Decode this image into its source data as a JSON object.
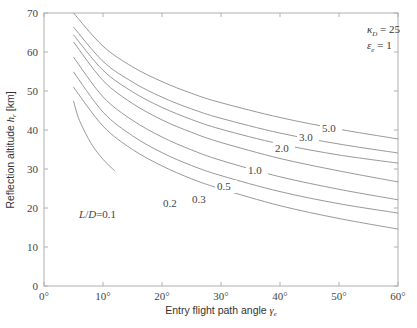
{
  "chart_data": {
    "type": "line",
    "title": "",
    "xlabel": "Entry flight path angle γ_e",
    "ylabel": "Reflection altitude h_r [km]",
    "xlim": [
      0,
      60
    ],
    "ylim": [
      0,
      70
    ],
    "x_ticks": [
      "0°",
      "10°",
      "20°",
      "30°",
      "40°",
      "50°",
      "60°"
    ],
    "y_ticks": [
      "0",
      "10",
      "20",
      "30",
      "40",
      "50",
      "60",
      "70"
    ],
    "grid": false,
    "legend": "inline curve labels",
    "annotations": [
      "κ_D = 25",
      "ε_e = 1"
    ],
    "series": [
      {
        "name": "L/D = 0.1",
        "label": "L/D = 0.1",
        "x": [
          5,
          6,
          8,
          10,
          12
        ],
        "y": [
          47.4,
          42.5,
          36.5,
          32.5,
          29.5
        ]
      },
      {
        "name": "0.2",
        "label": "0.2",
        "x": [
          5,
          10,
          15,
          20,
          25,
          30,
          40,
          50,
          60
        ],
        "y": [
          51.0,
          41.0,
          35.0,
          30.8,
          27.5,
          24.9,
          20.6,
          17.3,
          14.6
        ]
      },
      {
        "name": "0.3",
        "label": "0.3",
        "x": [
          5,
          10,
          15,
          20,
          25,
          30,
          40,
          50,
          60
        ],
        "y": [
          54.9,
          44.6,
          38.5,
          34.2,
          30.9,
          28.3,
          24.2,
          21.1,
          18.7
        ]
      },
      {
        "name": "0.5",
        "label": "0.5",
        "x": [
          5,
          10,
          15,
          20,
          25,
          30,
          40,
          50,
          60
        ],
        "y": [
          58.7,
          48.5,
          42.5,
          38.2,
          34.9,
          32.2,
          28.0,
          24.8,
          22.1
        ]
      },
      {
        "name": "1.0",
        "label": "1.0",
        "x": [
          5,
          10,
          15,
          20,
          25,
          30,
          40,
          50,
          60
        ],
        "y": [
          62.6,
          52.7,
          46.8,
          42.6,
          39.4,
          36.8,
          32.7,
          29.5,
          26.7
        ]
      },
      {
        "name": "2.0",
        "label": "2.0",
        "x": [
          5,
          10,
          15,
          20,
          25,
          30,
          40,
          50,
          60
        ],
        "y": [
          64.4,
          55.3,
          49.8,
          45.8,
          42.7,
          40.2,
          36.4,
          33.6,
          31.5
        ]
      },
      {
        "name": "3.0",
        "label": "3.0",
        "x": [
          5,
          10,
          15,
          20,
          25,
          30,
          40,
          50,
          60
        ],
        "y": [
          66.4,
          57.6,
          52.3,
          48.4,
          45.4,
          43.0,
          39.2,
          36.4,
          34.1
        ]
      },
      {
        "name": "5.0",
        "label": "5.0",
        "x": [
          5,
          10,
          15,
          20,
          25,
          30,
          40,
          50,
          60
        ],
        "y": [
          70.0,
          61.5,
          56.2,
          52.4,
          49.4,
          47.0,
          43.2,
          40.2,
          37.7
        ]
      }
    ]
  },
  "labels": {
    "xlabel_text": "Entry flight path angle ",
    "xlabel_sym": "γ",
    "xlabel_sub": "e",
    "ylabel_text": "Reflection altitude ",
    "ylabel_sym": "h",
    "ylabel_sub": "r",
    "ylabel_unit": " [km]",
    "kappa_sym": "κ",
    "kappa_sub": "D",
    "kappa_val": " = 25",
    "eps_sym": "ε",
    "eps_sub": "e",
    "eps_val": " = 1"
  },
  "colors": {
    "axis": "#b0b0b0",
    "curve": "#8c8c8c",
    "text": "#444444"
  }
}
